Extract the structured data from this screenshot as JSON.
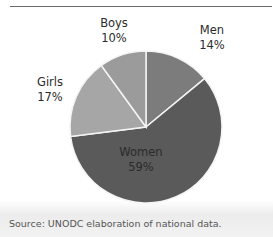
{
  "header": {
    "title_fragment": "g      y,"
  },
  "chart_data": {
    "type": "pie",
    "title": "",
    "categories": [
      "Men",
      "Women",
      "Girls",
      "Boys"
    ],
    "values": [
      14,
      59,
      17,
      10
    ],
    "unit": "%",
    "colors": [
      "#7c7c7c",
      "#5a5a5a",
      "#a6a6a6",
      "#9b9b9b"
    ],
    "labels": [
      {
        "name": "Men",
        "pct": "14%"
      },
      {
        "name": "Women",
        "pct": "59%"
      },
      {
        "name": "Girls",
        "pct": "17%"
      },
      {
        "name": "Boys",
        "pct": "10%"
      }
    ],
    "start_angle_deg": 0,
    "direction": "clockwise"
  },
  "footer": {
    "source": "Source: UNODC elaboration of national data."
  }
}
